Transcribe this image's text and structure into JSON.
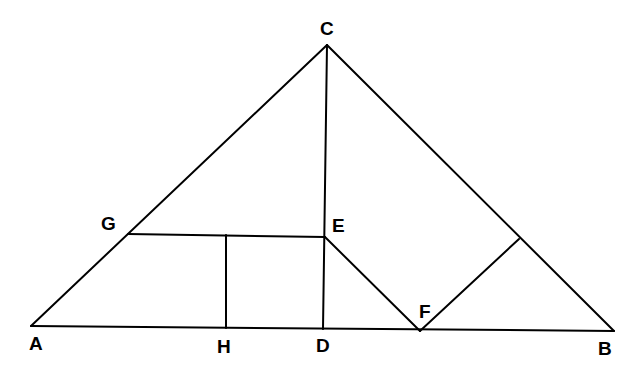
{
  "diagram": {
    "type": "geometry",
    "points": {
      "A": {
        "label": "A",
        "x": 31,
        "y": 326
      },
      "B": {
        "label": "B",
        "x": 614,
        "y": 331
      },
      "C": {
        "label": "C",
        "x": 327,
        "y": 45
      },
      "D": {
        "label": "D",
        "x": 323,
        "y": 329
      },
      "E": {
        "label": "E",
        "x": 325,
        "y": 237
      },
      "F": {
        "label": "F",
        "x": 420,
        "y": 331
      },
      "G": {
        "label": "G",
        "x": 128,
        "y": 234
      },
      "H": {
        "label": "H",
        "x": 226,
        "y": 328
      },
      "P": {
        "label": "",
        "x": 519,
        "y": 239
      }
    },
    "segments": [
      [
        "A",
        "B"
      ],
      [
        "A",
        "C"
      ],
      [
        "C",
        "B"
      ],
      [
        "C",
        "D"
      ],
      [
        "G",
        "E"
      ],
      [
        "H",
        "G_H_top"
      ],
      [
        "E",
        "F"
      ],
      [
        "F",
        "P"
      ]
    ]
  }
}
